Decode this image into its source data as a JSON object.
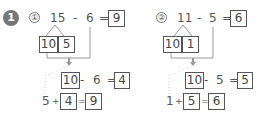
{
  "section_number": "1",
  "problems": [
    {
      "label": "①",
      "a": "15",
      "op1": "-",
      "b": "6",
      "eq": "=",
      "answer": "9",
      "split_ten": "10",
      "split_rest": "5",
      "step1": {
        "a": "10",
        "op": "-",
        "b": "6",
        "eq": "=",
        "result": "4"
      },
      "step2": {
        "a": "5",
        "op": "+",
        "b": "4",
        "eq": "=",
        "result": "9"
      }
    },
    {
      "label": "②",
      "a": "11",
      "op1": "-",
      "b": "5",
      "eq": "=",
      "answer": "6",
      "split_ten": "10",
      "split_rest": "1",
      "step1": {
        "a": "10",
        "op": "-",
        "b": "5",
        "eq": "=",
        "result": "5"
      },
      "step2": {
        "a": "1",
        "op": "+",
        "b": "5",
        "eq": "=",
        "result": "6"
      }
    }
  ],
  "colors": {
    "section_circle": "#777777",
    "line": "#888888",
    "dotted": "#bbbbbb"
  }
}
